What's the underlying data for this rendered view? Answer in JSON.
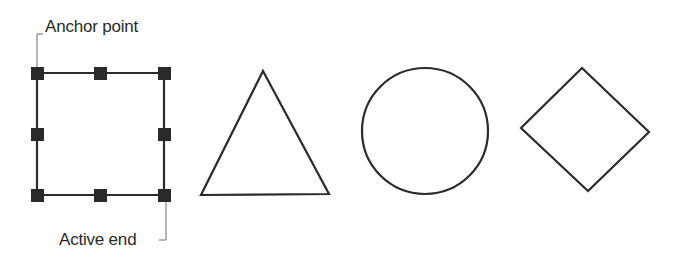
{
  "labels": {
    "anchor_point": "Anchor point",
    "active_end": "Active end"
  },
  "colors": {
    "stroke": "#2b2b2b",
    "handle": "#2a2a2a",
    "callout": "#6a6a6a",
    "background": "#ffffff"
  },
  "shapes": [
    {
      "type": "square-with-handles",
      "handles": 8
    },
    {
      "type": "triangle"
    },
    {
      "type": "circle"
    },
    {
      "type": "diamond"
    }
  ]
}
